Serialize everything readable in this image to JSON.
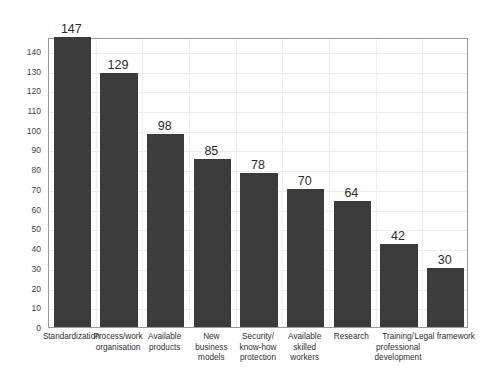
{
  "top_clip_text": "",
  "chart_data": {
    "type": "bar",
    "title": "",
    "subtitle": "",
    "xlabel": "",
    "ylabel": "",
    "ylim": [
      0,
      147
    ],
    "y_ticks": [
      0,
      10,
      20,
      30,
      40,
      50,
      60,
      70,
      80,
      90,
      100,
      110,
      120,
      130,
      140
    ],
    "y_tick_labels": [
      "0",
      "10",
      "20",
      "30",
      "40",
      "50",
      "60",
      "70",
      "80",
      "90",
      "100",
      "110",
      "120",
      "130",
      "140"
    ],
    "grid": true,
    "legend": "none",
    "bar_color": "#3b3b3b",
    "plot_border_color": "#9a9a9a",
    "categories": [
      "Standardization",
      "Process/work organisation",
      "Available products",
      "New business models",
      "Security/ know-how protection",
      "Available skilled workers",
      "Research",
      "Training/ professional development",
      "Legal framework"
    ],
    "category_lines": [
      [
        "Standardization"
      ],
      [
        "Process/work",
        "organisation"
      ],
      [
        "Available",
        "products"
      ],
      [
        "New",
        "business",
        "models"
      ],
      [
        "Security/",
        "know-how",
        "protection"
      ],
      [
        "Available",
        "skilled",
        "workers"
      ],
      [
        "Research"
      ],
      [
        "Training/",
        "professional",
        "development"
      ],
      [
        "Legal framework"
      ]
    ],
    "values": [
      147,
      129,
      98,
      85,
      78,
      70,
      64,
      42,
      30
    ],
    "value_labels": [
      "147",
      "129",
      "98",
      "85",
      "78",
      "70",
      "64",
      "42",
      "30"
    ]
  }
}
